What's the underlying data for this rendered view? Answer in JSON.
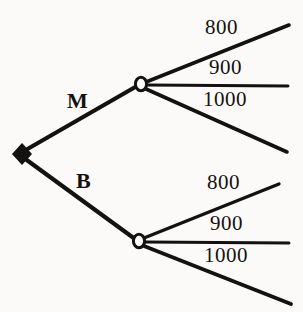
{
  "diagram": {
    "type": "decision-tree",
    "background_color": "#fbfaf8",
    "ink_color": "#141210"
  },
  "nodes": {
    "root": {
      "name": "decision-node",
      "shape": "filled-diamond",
      "x": 22,
      "y": 154
    },
    "chance_upper": {
      "name": "chance-node-m",
      "shape": "open-circle",
      "x": 141,
      "y": 84
    },
    "chance_lower": {
      "name": "chance-node-b",
      "shape": "open-circle",
      "x": 139,
      "y": 241
    }
  },
  "branches": {
    "m": {
      "label": "M",
      "label_x": 67,
      "label_y": 90
    },
    "b": {
      "label": "B",
      "label_x": 76,
      "label_y": 170
    }
  },
  "outcomes": {
    "upper": [
      {
        "label": "800",
        "label_x": 205,
        "label_y": 17
      },
      {
        "label": "900",
        "label_x": 209,
        "label_y": 57
      },
      {
        "label": "1000",
        "label_x": 203,
        "label_y": 89
      }
    ],
    "lower": [
      {
        "label": "800",
        "label_x": 207,
        "label_y": 172
      },
      {
        "label": "900",
        "label_x": 210,
        "label_y": 213
      },
      {
        "label": "1000",
        "label_x": 204,
        "label_y": 245
      }
    ]
  },
  "edges": {
    "root_to_m": {
      "x1": 24,
      "y1": 151,
      "x2": 137,
      "y2": 86
    },
    "root_to_b": {
      "x1": 24,
      "y1": 158,
      "x2": 135,
      "y2": 239
    },
    "m_out_800": {
      "x1": 146,
      "y1": 82,
      "x2": 289,
      "y2": 25
    },
    "m_out_900": {
      "x1": 147,
      "y1": 85,
      "x2": 288,
      "y2": 86
    },
    "m_out_1000": {
      "x1": 146,
      "y1": 89,
      "x2": 287,
      "y2": 152
    },
    "b_out_800": {
      "x1": 144,
      "y1": 238,
      "x2": 279,
      "y2": 184
    },
    "b_out_900": {
      "x1": 145,
      "y1": 242,
      "x2": 289,
      "y2": 243
    },
    "b_out_1000": {
      "x1": 144,
      "y1": 246,
      "x2": 291,
      "y2": 304
    }
  }
}
